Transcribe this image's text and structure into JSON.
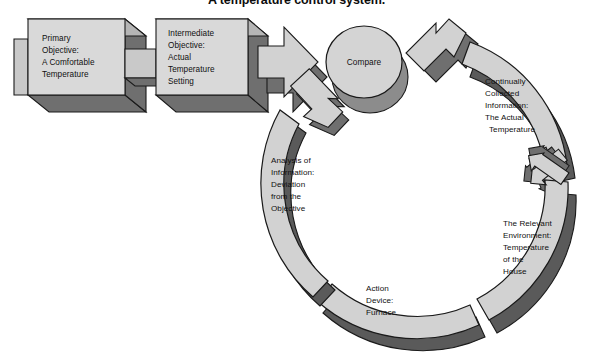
{
  "figure": {
    "title": "A temperature control system.",
    "background_color": "#ffffff"
  },
  "palette": {
    "face_light": "#d9d9d9",
    "face_mid": "#c9c9c9",
    "side_mid": "#a8a8a8",
    "shadow_dark": "#6f6f6f",
    "shadow_darker": "#5a5a5a",
    "outline": "#1a1a1a",
    "text": "#101010"
  },
  "nodes": {
    "primary_objective": {
      "id": "primary-objective",
      "lines": [
        "Primary",
        "Objective:",
        "A Comfortable",
        "Temperature"
      ],
      "shape": "3d-block-arrow"
    },
    "intermediate_objective": {
      "id": "intermediate-objective",
      "lines": [
        "Intermediate",
        "Objective:",
        "Actual",
        "Temperature",
        "Setting"
      ],
      "shape": "3d-block-arrow"
    },
    "compare": {
      "id": "compare",
      "lines": [
        "Compare"
      ],
      "shape": "3d-cylinder"
    },
    "collected_information": {
      "id": "continually-collected-information",
      "lines": [
        "Continually",
        "Collected",
        "Information:",
        "The Actual",
        "Temperature"
      ],
      "shape": "3d-arc-segment"
    },
    "relevant_environment": {
      "id": "relevant-environment",
      "lines": [
        "The Relevant",
        "Environment:",
        "Temperature",
        "of the",
        "House"
      ],
      "shape": "3d-arc-segment"
    },
    "action_device": {
      "id": "action-device",
      "lines": [
        "Action",
        "Device:",
        "Furnace"
      ],
      "shape": "3d-arc-segment"
    },
    "analysis_of_information": {
      "id": "analysis-of-information",
      "lines": [
        "Analysis of",
        "Information:",
        "Deviation",
        "from the",
        "Objective"
      ],
      "shape": "3d-arc-segment"
    }
  },
  "connectors": [
    {
      "id": "arrow-primary-to-intermediate",
      "from": "primary_objective",
      "to": "intermediate_objective",
      "direction": "right"
    },
    {
      "id": "arrow-intermediate-to-compare",
      "from": "intermediate_objective",
      "to": "compare",
      "direction": "right"
    },
    {
      "id": "arrow-collected-to-compare",
      "from": "collected_information",
      "to": "compare",
      "direction": "up-left"
    },
    {
      "id": "arrow-environment-to-collected",
      "from": "relevant_environment",
      "to": "collected_information",
      "direction": "up"
    },
    {
      "id": "arrow-furnace-to-environment",
      "from": "action_device",
      "to": "relevant_environment",
      "direction": "right"
    },
    {
      "id": "arrow-analysis-to-furnace",
      "from": "analysis_of_information",
      "to": "action_device",
      "direction": "down"
    },
    {
      "id": "arrow-compare-to-analysis",
      "from": "compare",
      "to": "analysis_of_information",
      "direction": "down-left"
    }
  ],
  "cycle": {
    "order": [
      "compare",
      "analysis_of_information",
      "action_device",
      "relevant_environment",
      "collected_information"
    ],
    "rotation": "counterclockwise"
  }
}
